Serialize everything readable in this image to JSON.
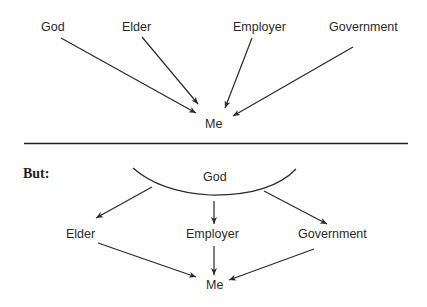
{
  "top_diagram": {
    "nodes": {
      "god": "God",
      "elder": "Elder",
      "employer": "Employer",
      "government": "Government",
      "me": "Me"
    },
    "edges": [
      {
        "from": "God",
        "to": "Me"
      },
      {
        "from": "Elder",
        "to": "Me"
      },
      {
        "from": "Employer",
        "to": "Me"
      },
      {
        "from": "Government",
        "to": "Me"
      }
    ]
  },
  "divider": true,
  "bottom_diagram": {
    "heading": "But:",
    "nodes": {
      "god": "God",
      "elder": "Elder",
      "employer": "Employer",
      "government": "Government",
      "me": "Me"
    },
    "edges": [
      {
        "from": "God",
        "to": "Elder"
      },
      {
        "from": "God",
        "to": "Employer"
      },
      {
        "from": "God",
        "to": "Government"
      },
      {
        "from": "Elder",
        "to": "Me"
      },
      {
        "from": "Employer",
        "to": "Me"
      },
      {
        "from": "Government",
        "to": "Me"
      }
    ]
  },
  "colors": {
    "ink": "#2a2a2a",
    "background": "#ffffff"
  }
}
